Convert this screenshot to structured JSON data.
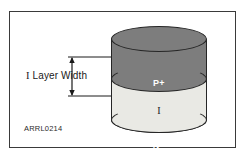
{
  "figure": {
    "id_label": "ARRL0214",
    "frame": {
      "border_color": "#3a3a3a",
      "background_color": "#ffffff"
    }
  },
  "diagram": {
    "type": "pin-diode-cross-section",
    "shape": "cylinder",
    "layers": [
      {
        "name": "p-plus-layer",
        "label": "P+",
        "position": "top",
        "fill_color": "#7d7d7d",
        "text_color": "#ffffff"
      },
      {
        "name": "intrinsic-layer",
        "label": "I",
        "position": "middle",
        "fill_color": "#e9e9e4",
        "text_color": "#1a1a1a"
      },
      {
        "name": "n-plus-layer",
        "label": "N+",
        "position": "bottom",
        "fill_color": "#b6b6b2",
        "text_color": "#ffffff"
      }
    ],
    "outline_color": "#262626"
  },
  "annotation": {
    "dimension_label_prefix": "I",
    "dimension_label_text": "Layer Width",
    "arrow_style": "double-headed-vertical",
    "arrow_color": "#1a1a1a",
    "extension_line_color": "#1a1a1a"
  }
}
